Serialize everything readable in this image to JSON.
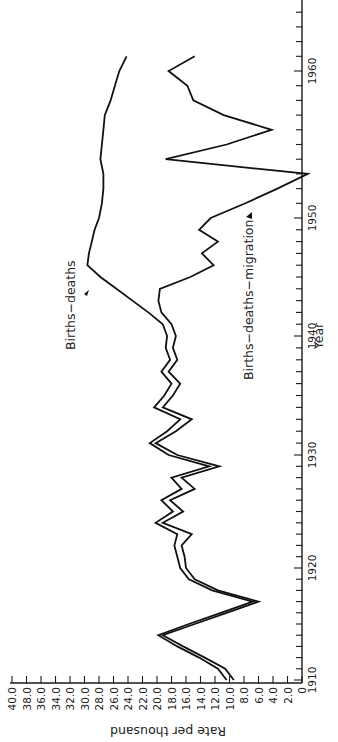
{
  "chart_data": {
    "type": "line",
    "orientation": "rotated 90° counter-clockwise (year axis vertical on right, rate axis horizontal along bottom)",
    "title": "",
    "xlabel": "Year",
    "ylabel": "Rate per thousand",
    "xlim": [
      1910,
      1962
    ],
    "ylim": [
      0,
      40
    ],
    "x_ticks": [
      1910,
      1920,
      1930,
      1940,
      1950,
      1960
    ],
    "y_ticks": [
      "0",
      "2.0",
      "4.0",
      "6.0",
      "8.0",
      "10.0",
      "12.0",
      "14.0",
      "16.0",
      "18.0",
      "20.0",
      "22.0",
      "24.0",
      "26.0",
      "28.0",
      "30.0",
      "32.0",
      "34.0",
      "36.0",
      "38.0",
      "40.0"
    ],
    "grid": false,
    "legend": "none (inline annotations with arrows)",
    "series": [
      {
        "name": "Births−deaths",
        "x": [
          1910,
          1911,
          1912,
          1913,
          1914,
          1915,
          1916,
          1917,
          1918,
          1919,
          1920,
          1921,
          1922,
          1923,
          1924,
          1925,
          1926,
          1927,
          1928,
          1929,
          1930,
          1931,
          1932,
          1933,
          1934,
          1935,
          1936,
          1937,
          1938,
          1939,
          1940,
          1941,
          1942,
          1943,
          1944,
          1945,
          1946,
          1947,
          1948,
          1949,
          1950,
          1951,
          1952,
          1953,
          1954,
          1955,
          1956,
          1957,
          1958,
          1959,
          1960,
          1961
        ],
        "values": [
          10.4,
          11.6,
          14.2,
          17.2,
          19.8,
          15.6,
          11.2,
          6.8,
          12.4,
          15.6,
          16.8,
          17.2,
          17.6,
          17.2,
          20.2,
          17.8,
          19.4,
          16.6,
          18.0,
          12.8,
          18.4,
          21.0,
          18.6,
          16.8,
          20.4,
          19.0,
          18.0,
          19.4,
          18.2,
          18.8,
          18.6,
          19.2,
          21.2,
          23.4,
          25.6,
          27.8,
          29.6,
          29.4,
          29.0,
          28.6,
          28.0,
          27.6,
          27.4,
          27.4,
          27.8,
          27.6,
          27.4,
          27.2,
          26.4,
          25.8,
          25.2,
          24.2
        ]
      },
      {
        "name": "Births−deaths−migration",
        "x": [
          1910,
          1911,
          1912,
          1913,
          1914,
          1915,
          1916,
          1917,
          1918,
          1919,
          1920,
          1921,
          1922,
          1923,
          1924,
          1925,
          1926,
          1927,
          1928,
          1929,
          1930,
          1931,
          1932,
          1933,
          1934,
          1935,
          1936,
          1937,
          1938,
          1939,
          1940,
          1941,
          1942,
          1943,
          1944,
          1945,
          1946,
          1947,
          1948,
          1949,
          1950,
          1951,
          1952,
          1953,
          1954,
          1955,
          1956,
          1957,
          1958,
          1959,
          1960,
          1961
        ],
        "values": [
          9.4,
          10.6,
          13.4,
          16.4,
          19.2,
          14.8,
          10.4,
          6.0,
          11.6,
          14.8,
          16.0,
          16.2,
          16.6,
          15.2,
          19.2,
          16.4,
          18.2,
          14.8,
          16.6,
          11.4,
          17.2,
          20.2,
          17.4,
          15.2,
          19.2,
          17.8,
          16.8,
          18.4,
          17.2,
          17.8,
          17.4,
          18.0,
          19.4,
          19.8,
          19.6,
          15.4,
          12.2,
          13.8,
          11.6,
          14.2,
          12.6,
          7.8,
          3.4,
          -0.8,
          18.8,
          10.4,
          4.2,
          10.8,
          15.0,
          15.8,
          18.4,
          14.8
        ]
      }
    ],
    "annotations": [
      {
        "text": "Births−deaths",
        "arrow_to_series": "Births−deaths",
        "approx_year": 1945.5
      },
      {
        "text": "Births−deaths−migration",
        "arrow_to_series": "Births−deaths−migration",
        "approx_year": 1950.5
      }
    ]
  },
  "labels": {
    "x_axis_title": "Year",
    "y_axis_title": "Rate per thousand",
    "annotation_1": "Births−deaths",
    "annotation_2": "Births−deaths−migration"
  }
}
